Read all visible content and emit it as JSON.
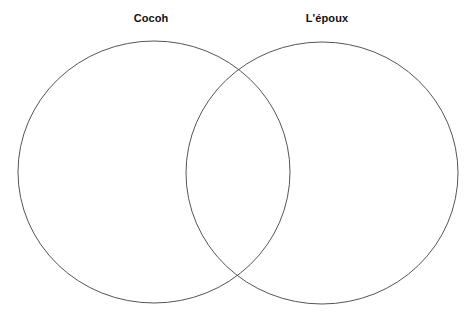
{
  "diagram": {
    "type": "venn",
    "sets": [
      {
        "label": "Cocoh",
        "shape": "ellipse",
        "cx": 154,
        "cy": 172,
        "rx": 136,
        "ry": 131,
        "stroke": "#555555",
        "fill": "none"
      },
      {
        "label": "L'épaux_placeholder",
        "shape": "ellipse",
        "cx": 322,
        "cy": 173,
        "rx": 136,
        "ry": 131,
        "stroke": "#555555",
        "fill": "none"
      }
    ],
    "regions": {
      "left_only": [],
      "intersection": [],
      "right_only": []
    }
  }
}
